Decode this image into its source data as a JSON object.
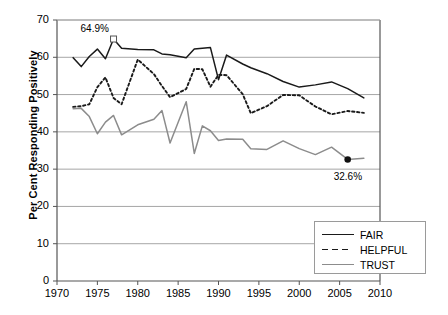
{
  "chart_data": {
    "type": "line",
    "title": "",
    "xlabel": "",
    "ylabel": "Per Cent Responding Positively",
    "xlim": [
      1970,
      2010
    ],
    "ylim": [
      0,
      70
    ],
    "xticks": [
      1970,
      1975,
      1980,
      1985,
      1990,
      1995,
      2000,
      2005,
      2010
    ],
    "yticks": [
      0,
      10,
      20,
      30,
      40,
      50,
      60,
      70
    ],
    "grid": "horizontal",
    "legend_position": "bottom-right",
    "legend": [
      "FAIR",
      "HELPFUL",
      "TRUST"
    ],
    "annotations": [
      {
        "text": "64.9%",
        "x": 1977,
        "y": 64.9,
        "series": "FAIR",
        "marker": "open-square"
      },
      {
        "text": "32.6%",
        "x": 2006,
        "y": 32.6,
        "series": "TRUST",
        "marker": "filled-circle"
      }
    ],
    "series": [
      {
        "name": "FAIR",
        "color": "#1a1a1a",
        "style": "solid",
        "x": [
          1972,
          1973,
          1974,
          1975,
          1976,
          1977,
          1978,
          1980,
          1982,
          1983,
          1984,
          1986,
          1987,
          1988,
          1989,
          1990,
          1991,
          1993,
          1994,
          1996,
          1998,
          2000,
          2002,
          2004,
          2006,
          2008
        ],
        "values": [
          59.9,
          57.5,
          60.2,
          62.2,
          59.6,
          64.9,
          62.4,
          62.1,
          62.0,
          60.9,
          60.7,
          59.9,
          62.2,
          62.4,
          62.6,
          54.0,
          60.6,
          58.2,
          57.2,
          55.6,
          53.5,
          52.0,
          52.6,
          53.4,
          51.6,
          49.1
        ]
      },
      {
        "name": "HELPFUL",
        "color": "#1a1a1a",
        "style": "dotted",
        "x": [
          1972,
          1973,
          1974,
          1975,
          1976,
          1977,
          1978,
          1980,
          1982,
          1983,
          1984,
          1986,
          1987,
          1988,
          1989,
          1990,
          1991,
          1993,
          1994,
          1996,
          1998,
          2000,
          2002,
          2004,
          2006,
          2008
        ],
        "values": [
          46.7,
          46.9,
          47.4,
          52.0,
          54.6,
          49.1,
          47.4,
          59.4,
          55.5,
          52.3,
          49.3,
          51.5,
          56.9,
          56.8,
          52.1,
          55.3,
          55.2,
          50.1,
          45.0,
          46.9,
          49.9,
          49.8,
          46.8,
          44.7,
          45.6,
          45.1
        ]
      },
      {
        "name": "TRUST",
        "color": "#8c8c8c",
        "style": "solid",
        "x": [
          1972,
          1973,
          1974,
          1975,
          1976,
          1977,
          1978,
          1980,
          1982,
          1983,
          1984,
          1986,
          1987,
          1988,
          1989,
          1990,
          1991,
          1993,
          1994,
          1996,
          1998,
          2000,
          2002,
          2004,
          2006,
          2008
        ],
        "values": [
          46.2,
          46.3,
          44.1,
          39.5,
          42.6,
          44.4,
          39.2,
          41.9,
          43.4,
          45.7,
          37.0,
          48.1,
          34.2,
          41.6,
          40.3,
          37.7,
          38.1,
          38.0,
          35.5,
          35.3,
          37.6,
          35.5,
          33.9,
          35.9,
          32.6,
          32.9
        ]
      }
    ]
  },
  "axis": {
    "y_title": "Per Cent Responding Positively"
  }
}
